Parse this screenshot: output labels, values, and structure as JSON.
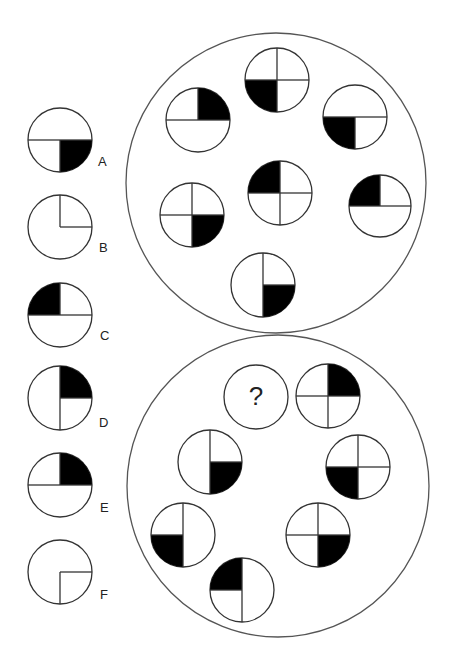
{
  "puzzle": {
    "question_mark": "?",
    "outer_circles": [
      {
        "id": "top-group",
        "cx": 276,
        "cy": 183,
        "r": 150
      },
      {
        "id": "bottom-group",
        "cx": 278,
        "cy": 486,
        "r": 151
      }
    ],
    "top_group_tiles": [
      {
        "cx": 198,
        "cy": 120,
        "r": 32,
        "lines": [
          "up",
          "left",
          "right"
        ],
        "fill": "TR"
      },
      {
        "cx": 277,
        "cy": 80,
        "r": 32,
        "lines": [
          "up",
          "down",
          "left",
          "right"
        ],
        "fill": "BL"
      },
      {
        "cx": 355,
        "cy": 117,
        "r": 32,
        "lines": [
          "down",
          "left",
          "right"
        ],
        "fill": "BL"
      },
      {
        "cx": 280,
        "cy": 193,
        "r": 32,
        "lines": [
          "up",
          "down",
          "left",
          "right"
        ],
        "fill": "TL"
      },
      {
        "cx": 192,
        "cy": 215,
        "r": 32,
        "lines": [
          "up",
          "down",
          "left",
          "right"
        ],
        "fill": "BR"
      },
      {
        "cx": 380,
        "cy": 206,
        "r": 31,
        "lines": [
          "up",
          "left",
          "right"
        ],
        "fill": "TL"
      },
      {
        "cx": 263,
        "cy": 285,
        "r": 32,
        "lines": [
          "up",
          "down",
          "right"
        ],
        "fill": "BR"
      }
    ],
    "bottom_group_tiles": [
      {
        "cx": 256,
        "cy": 397,
        "r": 32,
        "lines": [],
        "fill": null,
        "unknown": true
      },
      {
        "cx": 328,
        "cy": 396,
        "r": 32,
        "lines": [
          "up",
          "down",
          "left",
          "right"
        ],
        "fill": "TR"
      },
      {
        "cx": 210,
        "cy": 462,
        "r": 32,
        "lines": [
          "up",
          "down",
          "right"
        ],
        "fill": "BR"
      },
      {
        "cx": 358,
        "cy": 467,
        "r": 32,
        "lines": [
          "up",
          "down",
          "left",
          "right"
        ],
        "fill": "BL"
      },
      {
        "cx": 183,
        "cy": 535,
        "r": 32,
        "lines": [
          "up",
          "down",
          "left"
        ],
        "fill": "BL"
      },
      {
        "cx": 318,
        "cy": 535,
        "r": 32,
        "lines": [
          "up",
          "down",
          "left",
          "right"
        ],
        "fill": "BR"
      },
      {
        "cx": 242,
        "cy": 590,
        "r": 32,
        "lines": [
          "up",
          "down",
          "left"
        ],
        "fill": "TL"
      }
    ],
    "options": [
      {
        "label": "A",
        "cx": 60,
        "cy": 140,
        "r": 32,
        "lines": [
          "down",
          "left",
          "right"
        ],
        "fill": "BR",
        "lx": 98,
        "ly": 154
      },
      {
        "label": "B",
        "cx": 60,
        "cy": 227,
        "r": 32,
        "lines": [
          "up",
          "right"
        ],
        "fill": null,
        "lx": 99,
        "ly": 240
      },
      {
        "label": "C",
        "cx": 60,
        "cy": 315,
        "r": 32,
        "lines": [
          "up",
          "left",
          "right"
        ],
        "fill": "TL",
        "lx": 100,
        "ly": 328
      },
      {
        "label": "D",
        "cx": 60,
        "cy": 398,
        "r": 32,
        "lines": [
          "up",
          "down",
          "right"
        ],
        "fill": "TR",
        "lx": 99,
        "ly": 415
      },
      {
        "label": "E",
        "cx": 60,
        "cy": 485,
        "r": 32,
        "lines": [
          "up",
          "left",
          "right"
        ],
        "fill": "TR",
        "lx": 100,
        "ly": 500
      },
      {
        "label": "F",
        "cx": 60,
        "cy": 572,
        "r": 32,
        "lines": [
          "down",
          "right"
        ],
        "fill": null,
        "lx": 100,
        "ly": 587
      }
    ],
    "colors": {
      "stroke": "#333333",
      "fill": "#000000",
      "background": "#ffffff",
      "outer_stroke": "#555555"
    }
  }
}
